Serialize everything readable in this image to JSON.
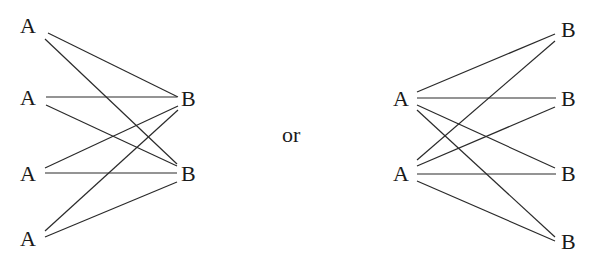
{
  "connector": {
    "label": "or",
    "x": 282,
    "y": 142
  },
  "left_graph": {
    "a_nodes": [
      {
        "label": "A",
        "x": 20,
        "y": 33
      },
      {
        "label": "A",
        "x": 20,
        "y": 105
      },
      {
        "label": "A",
        "x": 20,
        "y": 181
      },
      {
        "label": "A",
        "x": 20,
        "y": 246
      }
    ],
    "b_nodes": [
      {
        "label": "B",
        "x": 181,
        "y": 106
      },
      {
        "label": "B",
        "x": 181,
        "y": 181
      }
    ],
    "edges": [
      {
        "from": "A1",
        "to": "B1",
        "x1": 48,
        "y1": 33,
        "x2": 178,
        "y2": 97
      },
      {
        "from": "A1",
        "to": "B2",
        "x1": 45,
        "y1": 39,
        "x2": 177,
        "y2": 164
      },
      {
        "from": "A2",
        "to": "B1",
        "x1": 46,
        "y1": 97,
        "x2": 177,
        "y2": 97
      },
      {
        "from": "A2",
        "to": "B2",
        "x1": 46,
        "y1": 105,
        "x2": 177,
        "y2": 166
      },
      {
        "from": "A3",
        "to": "B1",
        "x1": 45,
        "y1": 168,
        "x2": 178,
        "y2": 106
      },
      {
        "from": "A3",
        "to": "B2",
        "x1": 45,
        "y1": 173,
        "x2": 177,
        "y2": 173
      },
      {
        "from": "A4",
        "to": "B1",
        "x1": 45,
        "y1": 231,
        "x2": 178,
        "y2": 110
      },
      {
        "from": "A4",
        "to": "B2",
        "x1": 45,
        "y1": 237,
        "x2": 177,
        "y2": 182
      }
    ]
  },
  "right_graph": {
    "a_nodes": [
      {
        "label": "A",
        "x": 393,
        "y": 106
      },
      {
        "label": "A",
        "x": 393,
        "y": 181
      }
    ],
    "b_nodes": [
      {
        "label": "B",
        "x": 561,
        "y": 37
      },
      {
        "label": "B",
        "x": 561,
        "y": 106
      },
      {
        "label": "B",
        "x": 561,
        "y": 181
      },
      {
        "label": "B",
        "x": 561,
        "y": 249
      }
    ],
    "edges": [
      {
        "from": "A1",
        "to": "B1",
        "x1": 417,
        "y1": 92,
        "x2": 555,
        "y2": 34
      },
      {
        "from": "A1",
        "to": "B2",
        "x1": 417,
        "y1": 98,
        "x2": 556,
        "y2": 98
      },
      {
        "from": "A1",
        "to": "B3",
        "x1": 417,
        "y1": 105,
        "x2": 555,
        "y2": 168
      },
      {
        "from": "A1",
        "to": "B4",
        "x1": 417,
        "y1": 110,
        "x2": 555,
        "y2": 237
      },
      {
        "from": "A2",
        "to": "B1",
        "x1": 417,
        "y1": 160,
        "x2": 555,
        "y2": 41
      },
      {
        "from": "A2",
        "to": "B2",
        "x1": 417,
        "y1": 166,
        "x2": 555,
        "y2": 107
      },
      {
        "from": "A2",
        "to": "B3",
        "x1": 417,
        "y1": 174,
        "x2": 556,
        "y2": 174
      },
      {
        "from": "A2",
        "to": "B4",
        "x1": 417,
        "y1": 181,
        "x2": 555,
        "y2": 241
      }
    ]
  }
}
